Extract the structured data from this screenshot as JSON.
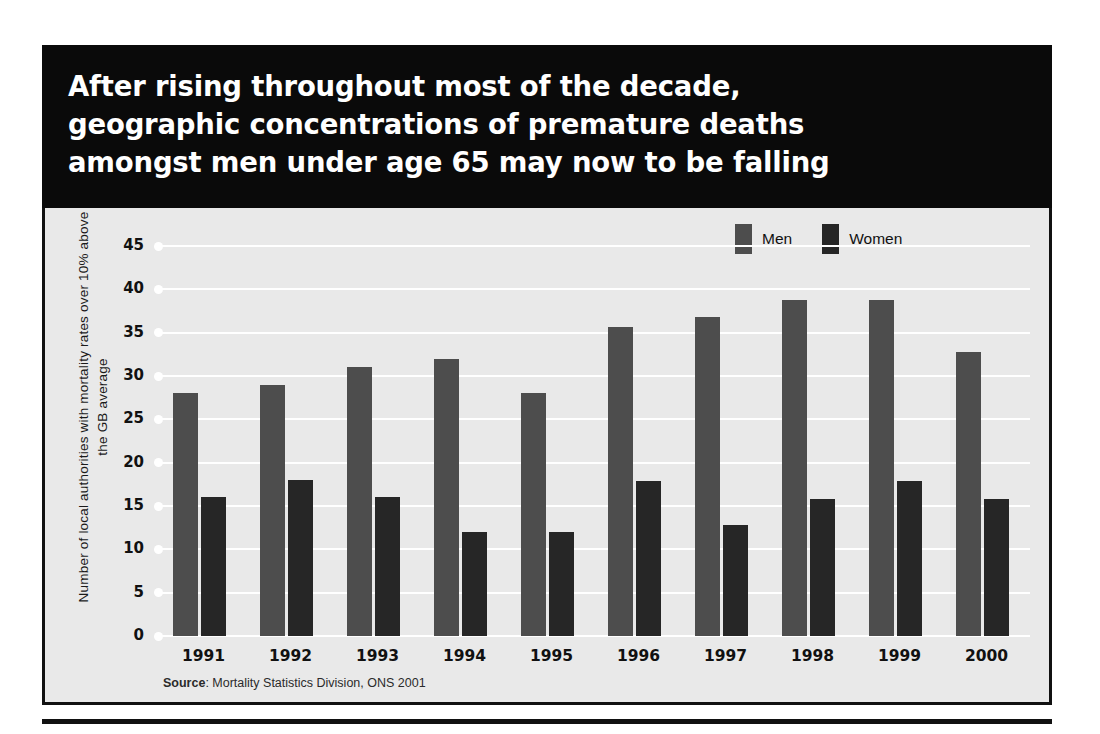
{
  "headline": "After rising throughout most of the decade,\ngeographic concentrations of premature deaths\namongst men under age 65 may now to be falling",
  "legend": {
    "men_label": "Men",
    "women_label": "Women",
    "men_color": "#4d4d4d",
    "women_color": "#262626"
  },
  "source": {
    "prefix": "Source",
    "text": ": Mortality Statistics Division, ONS 2001"
  },
  "chart_data": {
    "type": "bar",
    "title": "After rising throughout most of the decade, geographic concentrations of premature deaths amongst men under age 65 may now to be falling",
    "xlabel": "",
    "ylabel": "Number of local authorities with mortality rates over 10% above the GB average",
    "ylim": [
      0,
      45
    ],
    "yticks": [
      0,
      5,
      10,
      15,
      20,
      25,
      30,
      35,
      40,
      45
    ],
    "ytick_labels": [
      "0",
      "5",
      "10",
      "15",
      "20",
      "25",
      "30",
      "35",
      "40",
      "45"
    ],
    "grid": true,
    "legend_position": "top-right",
    "categories": [
      "1991",
      "1992",
      "1993",
      "1994",
      "1995",
      "1996",
      "1997",
      "1998",
      "1999",
      "2000"
    ],
    "series": [
      {
        "name": "Men",
        "color": "#4d4d4d",
        "values": [
          28,
          29,
          31,
          32,
          28,
          35.7,
          36.8,
          38.8,
          38.8,
          32.8
        ]
      },
      {
        "name": "Women",
        "color": "#262626",
        "values": [
          16,
          18,
          16,
          12,
          12,
          17.9,
          12.8,
          15.8,
          17.9,
          15.8
        ]
      }
    ]
  }
}
